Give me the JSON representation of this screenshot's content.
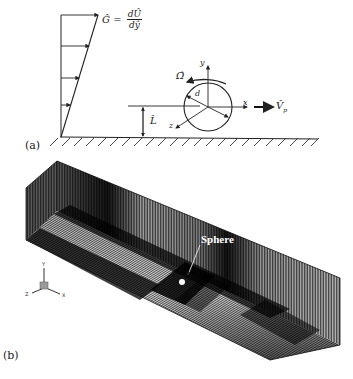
{
  "figure": {
    "panel_a": {
      "label": "(a)",
      "shear_rate_label": "Ĝ = dÛ/dŷ",
      "shear_lhs": "Ĝ =",
      "shear_num": "dÛ",
      "shear_den": "dŷ",
      "rotation_label": "Ω̂",
      "diameter_label": "d",
      "height_label": "L̂",
      "velocity_label": "V̂",
      "velocity_subscript": "p",
      "axis_x": "x",
      "axis_y": "y",
      "axis_z": "z"
    },
    "panel_b": {
      "label": "(b)",
      "sphere_label": "Sphere",
      "triad": {
        "x": "X",
        "y": "Y",
        "z": "Z"
      }
    },
    "colors": {
      "line": "#222222",
      "mesh_dark": "#0a0a0a",
      "mesh_light": "#bdbdbd",
      "background": "#ffffff"
    }
  }
}
